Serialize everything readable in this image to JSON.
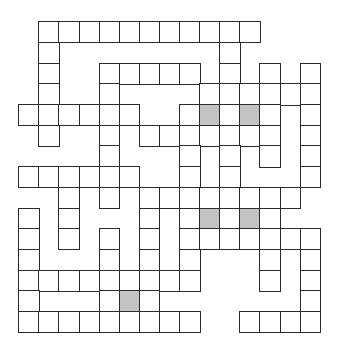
{
  "puzzle": {
    "type": "crossword",
    "columns": 15,
    "rows": 15,
    "origin": {
      "x": 19,
      "y": 22
    },
    "cell_size": {
      "w": 20.1,
      "h": 20.7
    },
    "colors": {
      "line": "#2b2b2b",
      "blank": "#ffffff",
      "shaded": "#c3c3c3"
    },
    "grid_rows": [
      {
        "row": 0,
        "cells": [
          1,
          2,
          3,
          4,
          5,
          6,
          7,
          8,
          9,
          10,
          11
        ],
        "shaded": []
      },
      {
        "row": 1,
        "cells": [
          1,
          10
        ],
        "shaded": []
      },
      {
        "row": 2,
        "cells": [
          1,
          4,
          5,
          6,
          7,
          8,
          10,
          12,
          14
        ],
        "shaded": []
      },
      {
        "row": 3,
        "cells": [
          1,
          4,
          9,
          10,
          11,
          12,
          13,
          14
        ],
        "shaded": []
      },
      {
        "row": 4,
        "cells": [
          0,
          1,
          2,
          3,
          4,
          5,
          8,
          9,
          10,
          11,
          12,
          14
        ],
        "shaded": [
          9,
          11
        ]
      },
      {
        "row": 5,
        "cells": [
          1,
          4,
          6,
          7,
          8,
          9,
          10,
          11,
          12,
          14
        ],
        "shaded": []
      },
      {
        "row": 6,
        "cells": [
          4,
          8,
          10,
          12,
          14
        ],
        "shaded": []
      },
      {
        "row": 7,
        "cells": [
          0,
          1,
          2,
          3,
          4,
          5,
          8,
          10,
          14
        ],
        "shaded": []
      },
      {
        "row": 8,
        "cells": [
          2,
          4,
          6,
          7,
          8,
          9,
          10,
          11,
          12,
          13
        ],
        "shaded": []
      },
      {
        "row": 9,
        "cells": [
          0,
          2,
          6,
          8,
          9,
          10,
          11,
          12
        ],
        "shaded": [
          9,
          11
        ]
      },
      {
        "row": 10,
        "cells": [
          0,
          2,
          4,
          6,
          8,
          9,
          10,
          11,
          12,
          13,
          14
        ],
        "shaded": []
      },
      {
        "row": 11,
        "cells": [
          0,
          4,
          6,
          8,
          12,
          14
        ],
        "shaded": []
      },
      {
        "row": 12,
        "cells": [
          0,
          1,
          2,
          3,
          4,
          5,
          6,
          7,
          8,
          12,
          14
        ],
        "shaded": []
      },
      {
        "row": 13,
        "cells": [
          0,
          4,
          5,
          6,
          14
        ],
        "shaded": [
          5
        ]
      },
      {
        "row": 14,
        "cells": [
          0,
          1,
          2,
          3,
          4,
          5,
          6,
          7,
          8,
          11,
          12,
          13,
          14
        ],
        "shaded": []
      }
    ]
  }
}
